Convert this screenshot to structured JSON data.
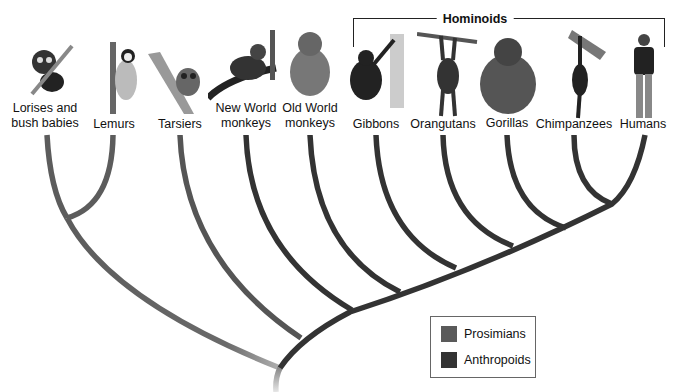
{
  "group": {
    "title": "Hominoids"
  },
  "taxa": [
    {
      "label": "Lorises and bush babies",
      "line1": "Lorises and",
      "line2": "bush babies",
      "x": 45,
      "group": "Prosimians"
    },
    {
      "label": "Lemurs",
      "line1": "Lemurs",
      "line2": "",
      "x": 114,
      "group": "Prosimians"
    },
    {
      "label": "Tarsiers",
      "line1": "Tarsiers",
      "line2": "",
      "x": 180,
      "group": "Anthropoids"
    },
    {
      "label": "New World monkeys",
      "line1": "New World",
      "line2": "monkeys",
      "x": 246,
      "group": "Anthropoids"
    },
    {
      "label": "Old World monkeys",
      "line1": "Old World",
      "line2": "monkeys",
      "x": 310,
      "group": "Anthropoids"
    },
    {
      "label": "Gibbons",
      "line1": "Gibbons",
      "line2": "",
      "x": 376,
      "group": "Anthropoids"
    },
    {
      "label": "Orangutans",
      "line1": "Orangutans",
      "line2": "",
      "x": 443,
      "group": "Anthropoids"
    },
    {
      "label": "Gorillas",
      "line1": "Gorillas",
      "line2": "",
      "x": 507,
      "group": "Anthropoids"
    },
    {
      "label": "Chimpanzees",
      "line1": "Chimpanzees",
      "line2": "",
      "x": 574,
      "group": "Anthropoids"
    },
    {
      "label": "Humans",
      "line1": "Humans",
      "line2": "",
      "x": 643,
      "group": "Anthropoids"
    }
  ],
  "legend": {
    "items": [
      {
        "label": "Prosimians",
        "color": "#5a5a5a"
      },
      {
        "label": "Anthropoids",
        "color": "#333333"
      }
    ]
  },
  "colors": {
    "prosimian_branch": "#5c5c5c",
    "anthropoid_branch": "#333333",
    "root_fade": "#bdbdbd"
  }
}
